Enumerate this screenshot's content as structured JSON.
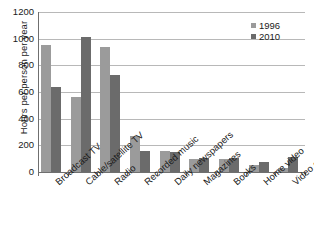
{
  "chart_data": {
    "type": "bar",
    "title": "",
    "xlabel": "",
    "ylabel": "Hours per person per year",
    "ylim": [
      0,
      1200
    ],
    "yticks": [
      0,
      200,
      400,
      600,
      800,
      1000,
      1200
    ],
    "grid": true,
    "legend_position": "top-right",
    "categories": [
      "Broadcast TV",
      "Cable/satellite TV",
      "Radio",
      "Recorded music",
      "Daily newspapers",
      "Magazines",
      "Books",
      "Home video",
      "Video games"
    ],
    "series": [
      {
        "name": "1996",
        "color": "#9b9b9b",
        "values": [
          950,
          560,
          935,
          270,
          155,
          100,
          95,
          50,
          30
        ]
      },
      {
        "name": "2010",
        "color": "#6b6b6b",
        "values": [
          640,
          1010,
          730,
          160,
          150,
          105,
          105,
          75,
          115
        ]
      }
    ]
  },
  "axis": {
    "y_title": "Hours per person per year",
    "y_tick_labels": [
      "0",
      "200",
      "400",
      "600",
      "800",
      "1000",
      "1200"
    ]
  },
  "legend": {
    "entries": [
      {
        "label": "1996",
        "color": "#9b9b9b"
      },
      {
        "label": "2010",
        "color": "#6b6b6b"
      }
    ]
  }
}
